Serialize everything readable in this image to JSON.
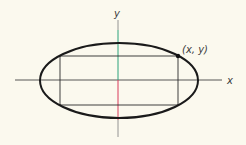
{
  "diagram": {
    "background": "#fbf9ee",
    "labels": {
      "x_axis": "x",
      "y_axis": "y",
      "point": "(x, y)"
    },
    "colors": {
      "ellipse": "#1a1a1a",
      "rectangle": "#2a2a2a",
      "x_axis": "#444444",
      "y_axis_positive": "#2aa27a",
      "y_axis_negative": "#d83a5a",
      "y_axis_ends": "#888888",
      "point": "#111111"
    },
    "geometry": {
      "origin": [
        118,
        80
      ],
      "ellipse": {
        "cx": 119,
        "cy": 80.5,
        "rx": 79,
        "ry": 37.5
      },
      "rectangle": {
        "x1": 60,
        "y1": 56,
        "x2": 178,
        "y2": 105
      },
      "point": [
        178,
        56
      ],
      "x_axis_extent": [
        15,
        222
      ],
      "y_axis_extent": [
        20,
        137
      ]
    }
  }
}
